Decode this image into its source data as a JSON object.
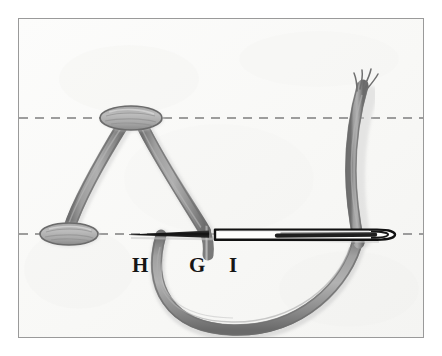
{
  "figure": {
    "caption": "Hand-drawn pencil diagram of a thread stitch with needle",
    "background_color": "#fbfbfa",
    "page_color": "#ffffff",
    "border_color": "#9a9a9a",
    "thread_color": "#919191",
    "thread_edge_color": "#6e6e6e",
    "needle_color": "#1a1a1a",
    "guideline_color": "#8d8d8d",
    "label_color": "#151515",
    "frame": {
      "x": 18,
      "y": 18,
      "width": 406,
      "height": 320
    },
    "guidelines": [
      {
        "name": "upper-guideline",
        "y": 117,
        "style": "dashed"
      },
      {
        "name": "lower-guideline",
        "y": 233,
        "style": "dashed"
      }
    ],
    "labels": [
      {
        "id": "label-h",
        "text": "H",
        "x": 131,
        "y": 272
      },
      {
        "id": "label-g",
        "text": "G",
        "x": 188,
        "y": 272
      },
      {
        "id": "label-i",
        "text": "I",
        "x": 226,
        "y": 272
      }
    ],
    "elements": {
      "top_bar": {
        "name": "top-stitch-bar",
        "cx": 130,
        "cy": 117,
        "rx": 30,
        "ry": 12
      },
      "bottom_bar": {
        "name": "bottom-stitch-bar",
        "cx": 68,
        "cy": 233,
        "rx": 28,
        "ry": 11
      },
      "needle": {
        "name": "sewing-needle",
        "tip_x": 128,
        "eye_x": 388,
        "y": 233
      },
      "thread_loop": {
        "name": "thread-loop",
        "description": "U-shaped loop below the guideline"
      },
      "thread_tail": {
        "name": "thread-tail",
        "description": "Vertical thread rising to upper right"
      }
    }
  }
}
